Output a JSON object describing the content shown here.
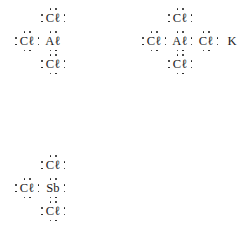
{
  "page": {
    "background_color": "#ffffff",
    "ink_color": "#141414"
  },
  "glyphs": {
    "chlorine": "Cℓ",
    "aluminum": "Aℓ",
    "potassium": "K",
    "antimony": "Sb",
    "dot": "·"
  },
  "structures": [
    {
      "id": "aluminum-trichloride",
      "formula": "AlCl3",
      "position": {
        "x": 14,
        "y": 10
      },
      "rows": [
        {
          "id": "top-row",
          "cells": [
            {
              "kind": "spacer"
            },
            {
              "kind": "atom",
              "name": "chlorine-top",
              "symbol": "Cℓ",
              "dots": [
                "top-left",
                "top-right",
                "left-top",
                "left-bottom",
                "right-top",
                "right-bottom"
              ]
            }
          ]
        },
        {
          "id": "middle-row",
          "cells": [
            {
              "kind": "atom",
              "name": "chlorine-left",
              "symbol": "Cℓ",
              "dots": [
                "top-left",
                "top-right",
                "bottom-left",
                "bottom-right",
                "left-top",
                "left-bottom",
                "right-top",
                "right-bottom"
              ]
            },
            {
              "kind": "atom",
              "name": "aluminum-center",
              "symbol": "Aℓ",
              "dots": [
                "top-left",
                "top-right",
                "bottom-left",
                "bottom-right"
              ]
            }
          ]
        },
        {
          "id": "bottom-row",
          "cells": [
            {
              "kind": "spacer"
            },
            {
              "kind": "atom",
              "name": "chlorine-bottom",
              "symbol": "Cℓ",
              "dots": [
                "top-left",
                "top-right",
                "bottom-left",
                "bottom-right",
                "left-top",
                "left-bottom",
                "right-top",
                "right-bottom"
              ]
            }
          ]
        }
      ]
    },
    {
      "id": "potassium-tetrachloroaluminate",
      "formula": "KAlCl4",
      "position": {
        "x": 141,
        "y": 10
      },
      "rows": [
        {
          "id": "top-row",
          "cells": [
            {
              "kind": "spacer"
            },
            {
              "kind": "atom",
              "name": "chlorine-top",
              "symbol": "Cℓ",
              "dots": [
                "top-left",
                "top-right",
                "left-top",
                "left-bottom",
                "right-top",
                "right-bottom"
              ]
            }
          ]
        },
        {
          "id": "middle-row",
          "cells": [
            {
              "kind": "atom",
              "name": "chlorine-left",
              "symbol": "Cℓ",
              "dots": [
                "top-left",
                "top-right",
                "bottom-left",
                "bottom-right",
                "left-top",
                "left-bottom",
                "right-top",
                "right-bottom"
              ]
            },
            {
              "kind": "atom",
              "name": "aluminum-center",
              "symbol": "Aℓ",
              "dots": [
                "top-left",
                "top-right",
                "bottom-left",
                "bottom-right",
                "right-top",
                "right-bottom"
              ]
            },
            {
              "kind": "atom",
              "name": "chlorine-right",
              "symbol": "Cℓ",
              "dots": [
                "top-left",
                "top-right",
                "bottom-left",
                "bottom-right",
                "right-top",
                "right-bottom"
              ]
            },
            {
              "kind": "atom",
              "name": "potassium",
              "symbol": "K",
              "dots": [
                "single-right"
              ]
            }
          ]
        },
        {
          "id": "bottom-row",
          "cells": [
            {
              "kind": "spacer"
            },
            {
              "kind": "atom",
              "name": "chlorine-bottom",
              "symbol": "Cℓ",
              "dots": [
                "top-left",
                "top-right",
                "bottom-left",
                "bottom-right",
                "left-top",
                "left-bottom",
                "right-top",
                "right-bottom"
              ]
            }
          ]
        }
      ]
    },
    {
      "id": "antimony-trichloride",
      "formula": "SbCl3",
      "position": {
        "x": 14,
        "y": 157
      },
      "rows": [
        {
          "id": "top-row",
          "cells": [
            {
              "kind": "spacer"
            },
            {
              "kind": "atom",
              "name": "chlorine-top",
              "symbol": "Cℓ",
              "dots": [
                "top-left",
                "top-right",
                "left-top",
                "left-bottom",
                "right-top",
                "right-bottom"
              ]
            }
          ]
        },
        {
          "id": "middle-row",
          "cells": [
            {
              "kind": "atom",
              "name": "chlorine-left",
              "symbol": "Cℓ",
              "dots": [
                "top-left",
                "top-right",
                "bottom-left",
                "bottom-right",
                "left-top",
                "left-bottom",
                "right-top",
                "right-bottom"
              ]
            },
            {
              "kind": "atom",
              "name": "antimony-center",
              "symbol": "Sb",
              "dots": [
                "top-left",
                "top-right",
                "bottom-left",
                "bottom-right",
                "right-top",
                "right-bottom"
              ]
            }
          ]
        },
        {
          "id": "bottom-row",
          "cells": [
            {
              "kind": "spacer"
            },
            {
              "kind": "atom",
              "name": "chlorine-bottom",
              "symbol": "Cℓ",
              "dots": [
                "top-left",
                "top-right",
                "bottom-left",
                "bottom-right",
                "left-top",
                "left-bottom",
                "right-top",
                "right-bottom"
              ]
            }
          ]
        }
      ]
    }
  ]
}
